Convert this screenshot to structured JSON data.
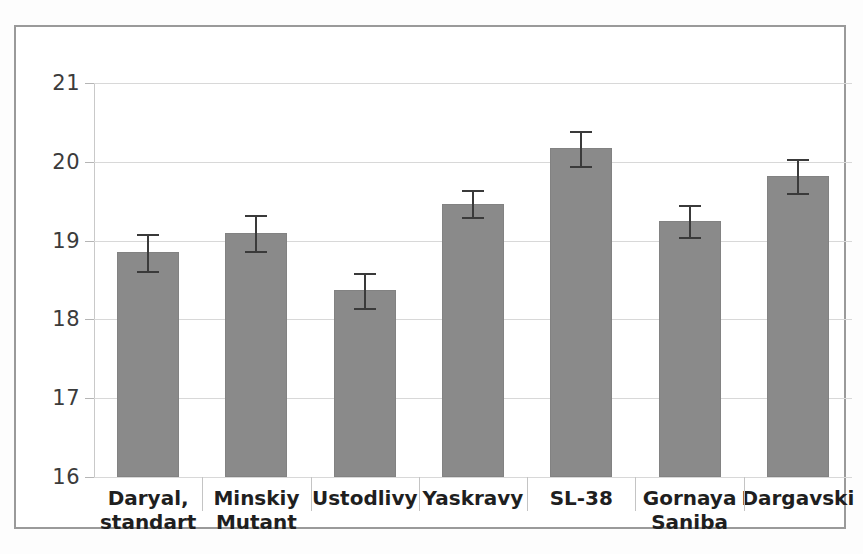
{
  "chart_data": {
    "type": "bar",
    "title": "",
    "subtitle": "",
    "xlabel": "",
    "ylabel": "",
    "categories": [
      "Daryal, standart",
      "Minskiy Mutant",
      "Ustodlivy",
      "Yaskravy",
      "SL-38",
      "Gornaya Saniba",
      "Dargavski"
    ],
    "category_lines": [
      [
        "Daryal,",
        "standart"
      ],
      [
        "Minskiy",
        "Mutant"
      ],
      [
        "Ustodlivy",
        ""
      ],
      [
        "Yaskravy",
        ""
      ],
      [
        "SL-38",
        ""
      ],
      [
        "Gornaya",
        "Saniba"
      ],
      [
        "Dargavski",
        ""
      ]
    ],
    "values": [
      18.85,
      19.1,
      18.37,
      19.47,
      20.17,
      19.25,
      19.82
    ],
    "errors": [
      0.23,
      0.23,
      0.22,
      0.17,
      0.22,
      0.2,
      0.22
    ],
    "ylim": [
      16,
      21
    ],
    "yticks": [
      16,
      17,
      18,
      19,
      20,
      21
    ],
    "ytick_labels": [
      "16",
      "17",
      "18",
      "19",
      "20",
      "21"
    ],
    "grid": true,
    "legend": false,
    "legend_position": "none",
    "error_bar_style": "capped",
    "bar_color": "#8a8a8a",
    "error_color": "#3a3a3a",
    "grid_color": "#d8d8d8",
    "axis_color": "#9d9d9d",
    "frame_color": "#9a9a9a",
    "background": "#ffffff"
  }
}
